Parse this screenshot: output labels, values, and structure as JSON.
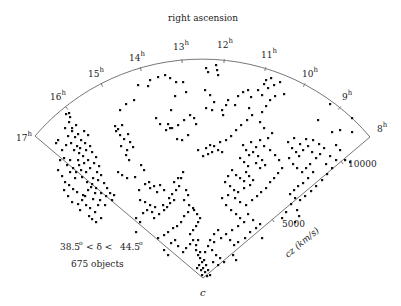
{
  "chart_data": {
    "type": "scatter",
    "title": "right ascension",
    "subtitle": "",
    "projection": "wedge (polar slice)",
    "radial_axis": {
      "label": "cz (km/s)",
      "ticks": [
        5000,
        10000
      ],
      "range": [
        0,
        12000
      ]
    },
    "angular_axis": {
      "label": "right ascension",
      "ticks": [
        "8h",
        "9h",
        "10h",
        "11h",
        "12h",
        "13h",
        "14h",
        "15h",
        "16h",
        "17h"
      ],
      "range_hours": [
        8,
        17
      ]
    },
    "annotations": {
      "declination": "38.5° < δ < 44.5°",
      "count": "675 objects",
      "apex": "c"
    },
    "n_objects": 675,
    "grid": false,
    "legend": null
  },
  "labels": {
    "title": "right ascension",
    "axis_cz": "cz (km/s)",
    "tick_5000": "5000",
    "tick_10000": "10000",
    "decl_lo": "38.5",
    "decl_mid": "< δ <",
    "decl_hi": "44.5",
    "deg": "o",
    "count": "675 objects",
    "apex": "c",
    "hours": [
      {
        "n": "17",
        "x": 16,
        "y": 141
      },
      {
        "n": "16",
        "x": 50,
        "y": 100
      },
      {
        "n": "15",
        "x": 88,
        "y": 77
      },
      {
        "n": "14",
        "x": 129,
        "y": 61
      },
      {
        "n": "13",
        "x": 173,
        "y": 50
      },
      {
        "n": "12",
        "x": 217,
        "y": 48
      },
      {
        "n": "11",
        "x": 261,
        "y": 58
      },
      {
        "n": "10",
        "x": 302,
        "y": 77
      },
      {
        "n": "9",
        "x": 342,
        "y": 100
      },
      {
        "n": "8",
        "x": 377,
        "y": 132
      }
    ],
    "sup": "h"
  },
  "points": [
    [
      66,
      114
    ],
    [
      69,
      113
    ],
    [
      70,
      117
    ],
    [
      69,
      122
    ],
    [
      72,
      128
    ],
    [
      76,
      125
    ],
    [
      72,
      131
    ],
    [
      65,
      128
    ],
    [
      68,
      136
    ],
    [
      75,
      137
    ],
    [
      78,
      134
    ],
    [
      81,
      140
    ],
    [
      84,
      131
    ],
    [
      88,
      135
    ],
    [
      85,
      143
    ],
    [
      80,
      148
    ],
    [
      77,
      146
    ],
    [
      74,
      150
    ],
    [
      79,
      153
    ],
    [
      83,
      156
    ],
    [
      86,
      150
    ],
    [
      90,
      146
    ],
    [
      92,
      152
    ],
    [
      88,
      160
    ],
    [
      84,
      163
    ],
    [
      79,
      165
    ],
    [
      81,
      170
    ],
    [
      86,
      172
    ],
    [
      90,
      168
    ],
    [
      94,
      163
    ],
    [
      96,
      157
    ],
    [
      99,
      166
    ],
    [
      97,
      172
    ],
    [
      93,
      178
    ],
    [
      98,
      180
    ],
    [
      101,
      175
    ],
    [
      104,
      183
    ],
    [
      107,
      188
    ],
    [
      110,
      193
    ],
    [
      114,
      195
    ],
    [
      112,
      200
    ],
    [
      106,
      196
    ],
    [
      101,
      193
    ],
    [
      96,
      188
    ],
    [
      92,
      184
    ],
    [
      88,
      190
    ],
    [
      85,
      196
    ],
    [
      82,
      200
    ],
    [
      78,
      204
    ],
    [
      75,
      178
    ],
    [
      70,
      172
    ],
    [
      67,
      165
    ],
    [
      64,
      158
    ],
    [
      62,
      150
    ],
    [
      66,
      145
    ],
    [
      71,
      143
    ],
    [
      60,
      160
    ],
    [
      58,
      170
    ],
    [
      62,
      176
    ],
    [
      65,
      182
    ],
    [
      69,
      185
    ],
    [
      73,
      189
    ],
    [
      77,
      192
    ],
    [
      83,
      195
    ],
    [
      86,
      205
    ],
    [
      90,
      208
    ],
    [
      95,
      212
    ],
    [
      89,
      216
    ],
    [
      92,
      219
    ],
    [
      96,
      222
    ],
    [
      101,
      218
    ],
    [
      98,
      205
    ],
    [
      100,
      200
    ],
    [
      105,
      205
    ],
    [
      93,
      199
    ],
    [
      76,
      172
    ],
    [
      73,
      168
    ],
    [
      70,
      160
    ],
    [
      78,
      160
    ],
    [
      82,
      177
    ],
    [
      87,
      182
    ],
    [
      91,
      187
    ],
    [
      95,
      193
    ],
    [
      58,
      140
    ],
    [
      56,
      143
    ],
    [
      115,
      126
    ],
    [
      118,
      129
    ],
    [
      122,
      125
    ],
    [
      120,
      135
    ],
    [
      124,
      139
    ],
    [
      128,
      134
    ],
    [
      130,
      142
    ],
    [
      133,
      147
    ],
    [
      127,
      150
    ],
    [
      121,
      146
    ],
    [
      116,
      131
    ],
    [
      126,
      155
    ],
    [
      129,
      160
    ],
    [
      118,
      172
    ],
    [
      122,
      175
    ],
    [
      127,
      178
    ],
    [
      135,
      177
    ],
    [
      141,
      165
    ],
    [
      144,
      170
    ],
    [
      149,
      182
    ],
    [
      154,
      186
    ],
    [
      160,
      185
    ],
    [
      164,
      190
    ],
    [
      157,
      192
    ],
    [
      150,
      188
    ],
    [
      145,
      184
    ],
    [
      139,
      190
    ],
    [
      140,
      200
    ],
    [
      145,
      202
    ],
    [
      150,
      205
    ],
    [
      155,
      207
    ],
    [
      152,
      212
    ],
    [
      147,
      210
    ],
    [
      143,
      213
    ],
    [
      154,
      218
    ],
    [
      159,
      214
    ],
    [
      164,
      210
    ],
    [
      167,
      207
    ],
    [
      163,
      205
    ],
    [
      170,
      203
    ],
    [
      174,
      200
    ],
    [
      169,
      198
    ],
    [
      172,
      194
    ],
    [
      176,
      190
    ],
    [
      179,
      186
    ],
    [
      181,
      178
    ],
    [
      183,
      172
    ],
    [
      178,
      178
    ],
    [
      174,
      182
    ],
    [
      186,
      190
    ],
    [
      188,
      195
    ],
    [
      184,
      200
    ],
    [
      189,
      205
    ],
    [
      193,
      208
    ],
    [
      188,
      212
    ],
    [
      184,
      216
    ],
    [
      181,
      222
    ],
    [
      177,
      226
    ],
    [
      173,
      228
    ],
    [
      168,
      232
    ],
    [
      164,
      235
    ],
    [
      158,
      238
    ],
    [
      171,
      243
    ],
    [
      175,
      240
    ],
    [
      178,
      246
    ],
    [
      183,
      252
    ],
    [
      186,
      248
    ],
    [
      190,
      244
    ],
    [
      193,
      240
    ],
    [
      190,
      234
    ],
    [
      193,
      230
    ],
    [
      196,
      226
    ],
    [
      198,
      222
    ],
    [
      200,
      218
    ],
    [
      197,
      214
    ],
    [
      194,
      210
    ],
    [
      196,
      250
    ],
    [
      198,
      255
    ],
    [
      200,
      258
    ],
    [
      202,
      262
    ],
    [
      199,
      265
    ],
    [
      203,
      268
    ],
    [
      205,
      272
    ],
    [
      201,
      270
    ],
    [
      197,
      268
    ],
    [
      206,
      265
    ],
    [
      208,
      270
    ],
    [
      204,
      260
    ],
    [
      200,
      252
    ],
    [
      196,
      245
    ],
    [
      198,
      240
    ],
    [
      210,
      275
    ],
    [
      207,
      276
    ],
    [
      202,
      275
    ],
    [
      205,
      252
    ],
    [
      208,
      246
    ],
    [
      210,
      240
    ],
    [
      214,
      234
    ],
    [
      218,
      230
    ],
    [
      214,
      242
    ],
    [
      212,
      250
    ],
    [
      216,
      255
    ],
    [
      220,
      258
    ],
    [
      224,
      262
    ],
    [
      218,
      265
    ],
    [
      213,
      262
    ],
    [
      120,
      110
    ],
    [
      126,
      104
    ],
    [
      134,
      100
    ],
    [
      138,
      85
    ],
    [
      148,
      86
    ],
    [
      150,
      80
    ],
    [
      158,
      77
    ],
    [
      165,
      75
    ],
    [
      170,
      78
    ],
    [
      176,
      82
    ],
    [
      183,
      82
    ],
    [
      186,
      92
    ],
    [
      175,
      96
    ],
    [
      171,
      110
    ],
    [
      156,
      118
    ],
    [
      160,
      124
    ],
    [
      166,
      130
    ],
    [
      170,
      128
    ],
    [
      178,
      125
    ],
    [
      184,
      120
    ],
    [
      190,
      115
    ],
    [
      194,
      118
    ],
    [
      196,
      124
    ],
    [
      188,
      135
    ],
    [
      182,
      140
    ],
    [
      177,
      139
    ],
    [
      172,
      128
    ],
    [
      168,
      124
    ],
    [
      206,
      68
    ],
    [
      208,
      72
    ],
    [
      217,
      70
    ],
    [
      218,
      75
    ],
    [
      216,
      65
    ],
    [
      205,
      90
    ],
    [
      210,
      95
    ],
    [
      214,
      102
    ],
    [
      206,
      108
    ],
    [
      212,
      110
    ],
    [
      223,
      115
    ],
    [
      226,
      105
    ],
    [
      228,
      100
    ],
    [
      222,
      110
    ],
    [
      235,
      105
    ],
    [
      238,
      96
    ],
    [
      243,
      92
    ],
    [
      248,
      90
    ],
    [
      251,
      97
    ],
    [
      249,
      108
    ],
    [
      252,
      115
    ],
    [
      247,
      120
    ],
    [
      241,
      125
    ],
    [
      236,
      130
    ],
    [
      231,
      136
    ],
    [
      226,
      140
    ],
    [
      220,
      142
    ],
    [
      214,
      146
    ],
    [
      218,
      150
    ],
    [
      222,
      152
    ],
    [
      212,
      152
    ],
    [
      208,
      154
    ],
    [
      203,
      156
    ],
    [
      198,
      150
    ],
    [
      206,
      148
    ],
    [
      210,
      145
    ],
    [
      243,
      145
    ],
    [
      246,
      150
    ],
    [
      249,
      155
    ],
    [
      253,
      152
    ],
    [
      256,
      147
    ],
    [
      251,
      142
    ],
    [
      258,
      156
    ],
    [
      262,
      160
    ],
    [
      265,
      165
    ],
    [
      260,
      168
    ],
    [
      256,
      163
    ],
    [
      248,
      166
    ],
    [
      244,
      162
    ],
    [
      240,
      158
    ],
    [
      246,
      172
    ],
    [
      249,
      176
    ],
    [
      253,
      180
    ],
    [
      250,
      185
    ],
    [
      244,
      188
    ],
    [
      238,
      192
    ],
    [
      235,
      198
    ],
    [
      240,
      202
    ],
    [
      246,
      205
    ],
    [
      252,
      200
    ],
    [
      257,
      196
    ],
    [
      261,
      192
    ],
    [
      266,
      188
    ],
    [
      270,
      182
    ],
    [
      274,
      178
    ],
    [
      278,
      173
    ],
    [
      282,
      168
    ],
    [
      279,
      160
    ],
    [
      275,
      155
    ],
    [
      270,
      150
    ],
    [
      264,
      146
    ],
    [
      260,
      140
    ],
    [
      268,
      138
    ],
    [
      272,
      133
    ],
    [
      264,
      128
    ],
    [
      260,
      122
    ],
    [
      262,
      112
    ],
    [
      266,
      106
    ],
    [
      270,
      100
    ],
    [
      275,
      96
    ],
    [
      268,
      88
    ],
    [
      264,
      84
    ],
    [
      258,
      90
    ],
    [
      266,
      80
    ],
    [
      271,
      78
    ],
    [
      274,
      85
    ],
    [
      280,
      82
    ],
    [
      284,
      94
    ],
    [
      262,
      95
    ],
    [
      232,
      170
    ],
    [
      236,
      175
    ],
    [
      240,
      178
    ],
    [
      244,
      181
    ],
    [
      228,
      176
    ],
    [
      225,
      182
    ],
    [
      230,
      186
    ],
    [
      234,
      190
    ],
    [
      228,
      195
    ],
    [
      222,
      198
    ],
    [
      226,
      205
    ],
    [
      231,
      210
    ],
    [
      236,
      214
    ],
    [
      240,
      218
    ],
    [
      244,
      222
    ],
    [
      238,
      226
    ],
    [
      232,
      230
    ],
    [
      226,
      234
    ],
    [
      221,
      238
    ],
    [
      230,
      240
    ],
    [
      234,
      245
    ],
    [
      238,
      242
    ],
    [
      245,
      238
    ],
    [
      250,
      232
    ],
    [
      256,
      228
    ],
    [
      260,
      224
    ],
    [
      253,
      220
    ],
    [
      248,
      214
    ],
    [
      288,
      142
    ],
    [
      292,
      148
    ],
    [
      296,
      152
    ],
    [
      299,
      156
    ],
    [
      303,
      150
    ],
    [
      308,
      146
    ],
    [
      312,
      152
    ],
    [
      316,
      158
    ],
    [
      320,
      154
    ],
    [
      324,
      148
    ],
    [
      319,
      144
    ],
    [
      313,
      140
    ],
    [
      306,
      139
    ],
    [
      300,
      144
    ],
    [
      294,
      138
    ],
    [
      289,
      158
    ],
    [
      293,
      164
    ],
    [
      297,
      168
    ],
    [
      302,
      172
    ],
    [
      306,
      168
    ],
    [
      310,
      164
    ],
    [
      313,
      172
    ],
    [
      308,
      178
    ],
    [
      303,
      183
    ],
    [
      298,
      186
    ],
    [
      294,
      190
    ],
    [
      290,
      194
    ],
    [
      295,
      198
    ],
    [
      300,
      200
    ],
    [
      305,
      196
    ],
    [
      311,
      191
    ],
    [
      316,
      186
    ],
    [
      322,
      180
    ],
    [
      327,
      174
    ],
    [
      332,
      168
    ],
    [
      336,
      160
    ],
    [
      330,
      156
    ],
    [
      326,
      164
    ],
    [
      336,
      145
    ],
    [
      340,
      150
    ],
    [
      345,
      160
    ],
    [
      350,
      162
    ],
    [
      340,
      130
    ],
    [
      352,
      132
    ],
    [
      332,
      132
    ],
    [
      330,
      104
    ],
    [
      352,
      118
    ],
    [
      318,
      120
    ],
    [
      297,
      210
    ],
    [
      299,
      216
    ],
    [
      295,
      222
    ],
    [
      291,
      204
    ],
    [
      286,
      212
    ],
    [
      282,
      218
    ],
    [
      64,
      190
    ],
    [
      68,
      196
    ],
    [
      72,
      202
    ],
    [
      80,
      210
    ],
    [
      136,
      218
    ],
    [
      140,
      222
    ],
    [
      136,
      232
    ],
    [
      164,
      250
    ],
    [
      168,
      255
    ],
    [
      233,
      255
    ],
    [
      236,
      260
    ],
    [
      262,
      238
    ]
  ]
}
